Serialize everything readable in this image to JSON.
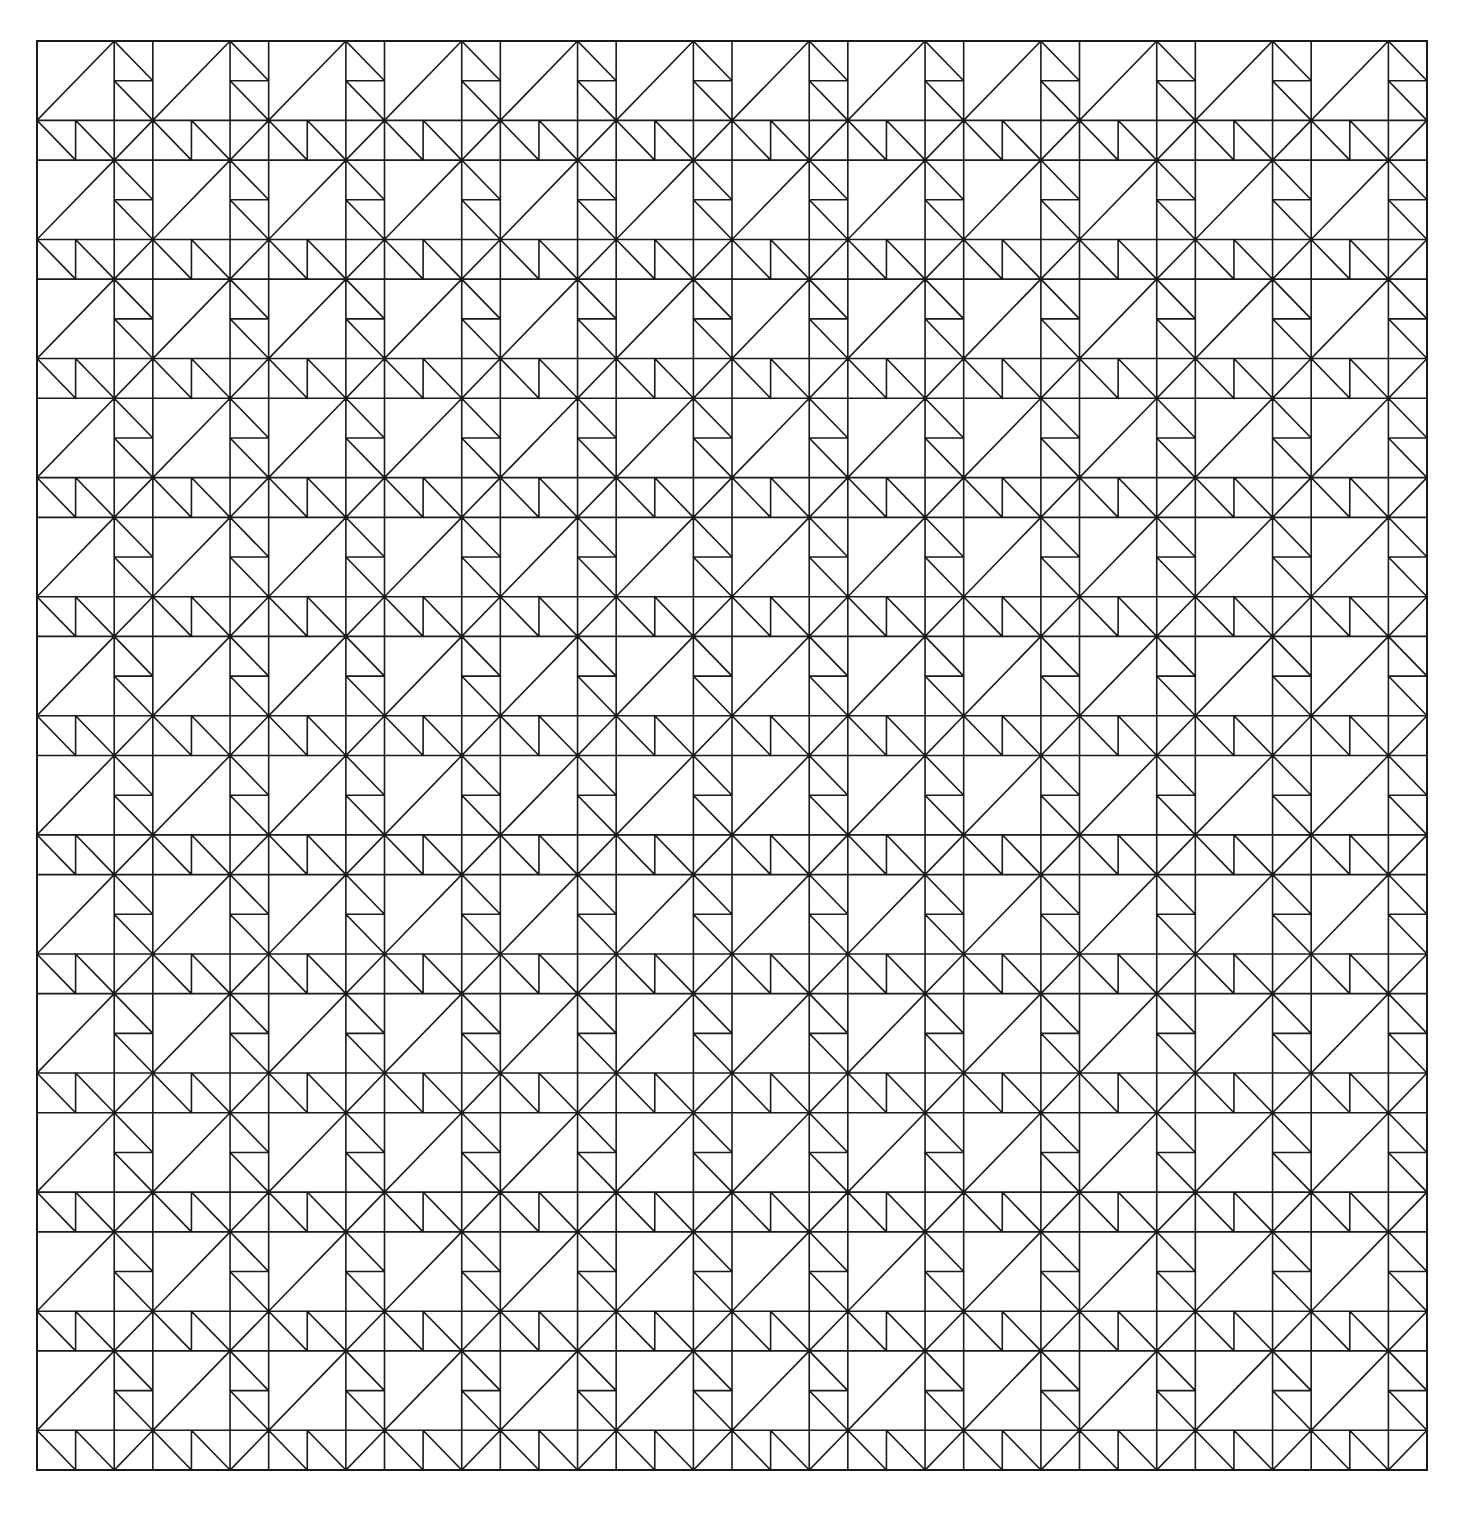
{
  "diagram": {
    "type": "repeating-tile-line-drawing",
    "canvas": {
      "width": 1468,
      "height": 1523,
      "background": "#ffffff"
    },
    "grid": {
      "x": 37,
      "y": 41,
      "width": 1390,
      "height": 1429,
      "cols": 12,
      "rows": 12
    },
    "stroke": {
      "color": "#1a1a1a",
      "width": 1.6
    },
    "tile_segments_unit": [
      [
        0,
        0,
        1,
        0
      ],
      [
        0,
        0,
        0,
        1
      ],
      [
        0,
        0.6667,
        1,
        0.6667
      ],
      [
        0.6667,
        0,
        0.6667,
        1
      ],
      [
        0,
        0.6667,
        0.6667,
        0
      ],
      [
        0.6667,
        0.3333,
        1,
        0.3333
      ],
      [
        0.6667,
        0,
        1,
        0.3333
      ],
      [
        0.6667,
        0.3333,
        1,
        0.6667
      ],
      [
        0.3333,
        0.6667,
        0.3333,
        1
      ],
      [
        0,
        0.6667,
        0.3333,
        1
      ],
      [
        0.3333,
        0.6667,
        0.6667,
        1
      ],
      [
        0.6667,
        1,
        1,
        0.6667
      ]
    ]
  }
}
